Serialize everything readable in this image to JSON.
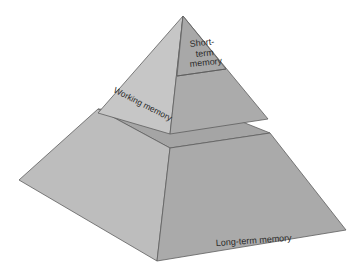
{
  "diagram": {
    "type": "pyramid",
    "tiers": [
      {
        "id": "short-term",
        "label_lines": [
          "Short-",
          "term",
          "memory"
        ]
      },
      {
        "id": "working",
        "label": "Working memory"
      },
      {
        "id": "long-term",
        "label": "Long-term memory"
      }
    ]
  },
  "colors": {
    "background": "#ffffff",
    "face_left": "#bdbdbd",
    "face_right": "#aaaaaa",
    "face_top": "#a3a3a3",
    "edge": "#5e5e5e",
    "text": "#2a2a2a"
  }
}
